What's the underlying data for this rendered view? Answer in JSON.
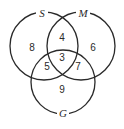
{
  "diagram": {
    "type": "venn",
    "sets": [
      {
        "name": "S",
        "cx": 44,
        "cy": 46,
        "r": 34
      },
      {
        "name": "M",
        "cx": 81,
        "cy": 46,
        "r": 34
      },
      {
        "name": "G",
        "cx": 63,
        "cy": 82,
        "r": 32
      }
    ],
    "regions": {
      "S_only": "8",
      "M_only": "6",
      "S_M": "4",
      "S_M_G": "3",
      "S_G": "5",
      "M_G": "7",
      "G_only": "9"
    },
    "line_color": "#2a2a2a"
  }
}
